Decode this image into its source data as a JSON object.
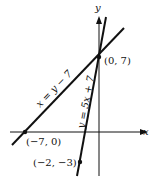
{
  "diagram": {
    "axes": {
      "x_label": "x",
      "y_label": "y"
    },
    "lines": [
      {
        "equation": "x = y − 7",
        "slope": 1,
        "intercept": 7
      },
      {
        "equation": "y = 5x + 7",
        "slope": 5,
        "intercept": 7
      }
    ],
    "points": [
      {
        "label": "(0, 7)",
        "x": 0,
        "y": 7
      },
      {
        "label": "(−7, 0)",
        "x": -7,
        "y": 0
      },
      {
        "label": "(−2, −3)",
        "x": -2,
        "y": -3
      }
    ],
    "colors": {
      "ink": "#111111",
      "background": "#ffffff"
    }
  }
}
